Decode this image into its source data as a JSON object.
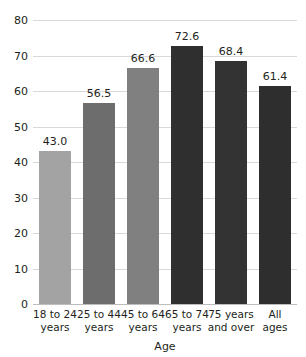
{
  "chart_data": {
    "type": "bar",
    "title": "",
    "xlabel": "Age",
    "ylabel": "",
    "categories": [
      "18 to 24 years",
      "25 to 44 years",
      "45 to 64 years",
      "65 to 74 years",
      "75 years and over",
      "All ages"
    ],
    "category_lines": [
      [
        "18 to 24",
        "years"
      ],
      [
        "25 to 44",
        "years"
      ],
      [
        "45 to 64",
        "years"
      ],
      [
        "65 to 74",
        "years"
      ],
      [
        "75 years",
        "and over"
      ],
      [
        "All",
        "ages"
      ]
    ],
    "values": [
      43.0,
      56.5,
      66.6,
      72.6,
      68.4,
      61.4
    ],
    "value_labels": [
      "43.0",
      "56.5",
      "66.6",
      "72.6",
      "68.4",
      "61.4"
    ],
    "bar_colors": [
      "#a3a3a3",
      "#6d6d6d",
      "#808080",
      "#2f2f2f",
      "#333333",
      "#2e2e2e"
    ],
    "ylim": [
      0,
      80
    ],
    "yticks": [
      0,
      10,
      20,
      30,
      40,
      50,
      60,
      70,
      80
    ],
    "ytick_labels": [
      "0",
      "10",
      "20",
      "30",
      "40",
      "50",
      "60",
      "70",
      "80"
    ],
    "grid": true,
    "legend": false,
    "gridline_color": "#d9d9d9",
    "axis_color": "#bdbdbd",
    "text_color": "#231f20"
  }
}
